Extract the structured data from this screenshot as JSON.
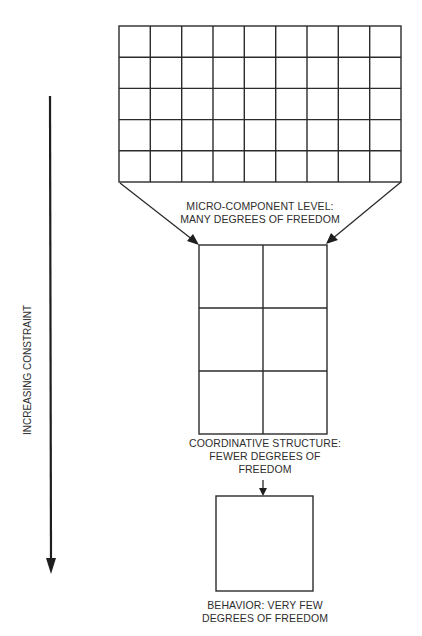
{
  "diagram": {
    "axis": {
      "label": "INCREASING CONSTRAINT",
      "direction": "down"
    },
    "levels": [
      {
        "name": "micro-component",
        "grid": {
          "columns": 9,
          "rows": 5
        },
        "label_lines": [
          "MICRO-COMPONENT LEVEL:",
          "MANY DEGREES OF FREEDOM"
        ]
      },
      {
        "name": "coordinative-structure",
        "grid": {
          "columns": 2,
          "rows": 3
        },
        "label_lines": [
          "COORDINATIVE STRUCTURE:",
          "FEWER DEGREES OF",
          "FREEDOM"
        ]
      },
      {
        "name": "behavior",
        "grid": {
          "columns": 1,
          "rows": 1
        },
        "label_lines": [
          "BEHAVIOR: VERY FEW",
          "DEGREES OF FREEDOM"
        ]
      }
    ],
    "colors": {
      "line": "#2b2b2b",
      "text": "#2e2e2e",
      "background": "#ffffff"
    }
  }
}
